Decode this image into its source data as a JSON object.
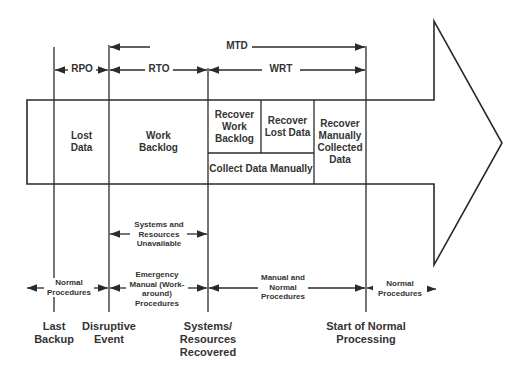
{
  "timeline_labels": {
    "mtd": "MTD",
    "rpo": "RPO",
    "rto": "RTO",
    "wrt": "WRT"
  },
  "boxes": {
    "lost_data": "Lost Data",
    "work_backlog": "Work Backlog",
    "recover_work_backlog": "Recover Work Backlog",
    "recover_lost_data": "Recover Lost Data",
    "recover_manually_collected": "Recover Manually Collected Data",
    "collect_data_manually": "Collect Data Manually"
  },
  "periods": {
    "systems_unavailable": "Systems and Resources Unavailable",
    "normal_before": "Normal Procedures",
    "emergency": "Emergency Manual (Work-around) Procedures",
    "manual_and_normal": "Manual and Normal Procedures",
    "normal_after": "Normal Procedures"
  },
  "milestones": {
    "last_backup": "Last Backup",
    "disruptive_event": "Disruptive Event",
    "systems_recovered": "Systems/ Resources Recovered",
    "start_normal": "Start of Normal Processing"
  },
  "colors": {
    "line": "#2a2a2a",
    "text": "#333333",
    "background": "#ffffff"
  }
}
